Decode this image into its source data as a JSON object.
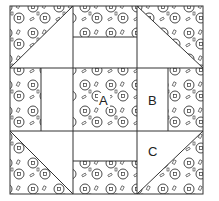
{
  "diagram": {
    "type": "quilt-block",
    "grid": "3x3",
    "labels": {
      "a": "A",
      "b": "B",
      "c": "C"
    },
    "pieces": [
      {
        "id": "corner-top-left",
        "shape": "half-square-triangle",
        "fabric": "print"
      },
      {
        "id": "top-middle",
        "shape": "two-strip-rectangle",
        "fabric": "print-over-plain"
      },
      {
        "id": "corner-top-right",
        "shape": "half-square-triangle",
        "fabric": "print"
      },
      {
        "id": "middle-left",
        "shape": "two-strip-rectangle",
        "fabric": "print-beside-plain"
      },
      {
        "id": "center",
        "shape": "square",
        "fabric": "print",
        "label": "A"
      },
      {
        "id": "middle-right",
        "shape": "two-strip-rectangle",
        "fabric": "plain-beside-print",
        "label": "B"
      },
      {
        "id": "corner-bottom-left",
        "shape": "half-square-triangle",
        "fabric": "print"
      },
      {
        "id": "bottom-middle",
        "shape": "two-strip-rectangle",
        "fabric": "plain-over-print"
      },
      {
        "id": "corner-bottom-right",
        "shape": "half-square-triangle",
        "fabric": "print",
        "label": "C"
      }
    ],
    "colors": {
      "line": "#333333",
      "background": "#ffffff"
    }
  }
}
